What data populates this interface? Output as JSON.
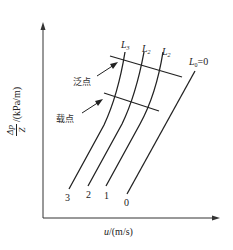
{
  "figure": {
    "type": "diagram",
    "y_axis": {
      "label_numerator": "Δp",
      "label_denominator": "Z",
      "label_unit": "/(kPa/m)"
    },
    "x_axis": {
      "label_var": "u",
      "label_unit": "/(m/s)"
    },
    "curves": [
      {
        "top_label": "L",
        "top_sub": "3",
        "bottom_label": "3"
      },
      {
        "top_label": "L",
        "top_sub": "2",
        "bottom_label": "2"
      },
      {
        "top_label": "L",
        "top_sub": "2",
        "bottom_label": "1"
      },
      {
        "top_label": "L",
        "top_sub": "0",
        "top_suffix": "=0",
        "bottom_label": "0"
      }
    ],
    "annotations": {
      "flooding_point": "泛点",
      "loading_point": "载点"
    },
    "colors": {
      "line": "#222222",
      "background": "#ffffff"
    }
  }
}
